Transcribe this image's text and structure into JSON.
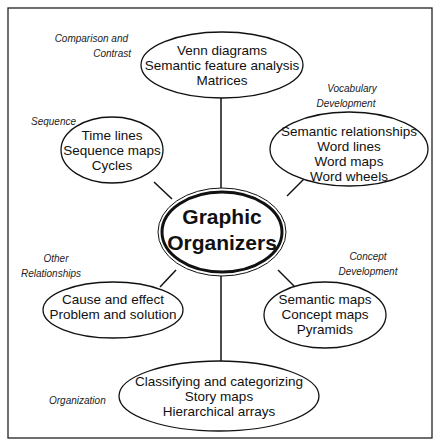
{
  "center": {
    "lines": [
      "Graphic",
      "Organizers"
    ]
  },
  "nodes": [
    {
      "category": [
        "Comparison and",
        "Contrast"
      ],
      "items": [
        "Venn diagrams",
        "Semantic feature analysis",
        "Matrices"
      ]
    },
    {
      "category": [
        "Vocabulary",
        "Development"
      ],
      "items": [
        "Semantic relationships",
        "Word lines",
        "Word maps",
        "Word wheels"
      ]
    },
    {
      "category": [
        "Sequence"
      ],
      "items": [
        "Time lines",
        "Sequence maps",
        "Cycles"
      ]
    },
    {
      "category": [
        "Other",
        "Relationships"
      ],
      "items": [
        "Cause and effect",
        "Problem and solution"
      ]
    },
    {
      "category": [
        "Concept",
        "Development"
      ],
      "items": [
        "Semantic maps",
        "Concept maps",
        "Pyramids"
      ]
    },
    {
      "category": [
        "Organization"
      ],
      "items": [
        "Classifying and categorizing",
        "Story maps",
        "Hierarchical arrays"
      ]
    }
  ]
}
